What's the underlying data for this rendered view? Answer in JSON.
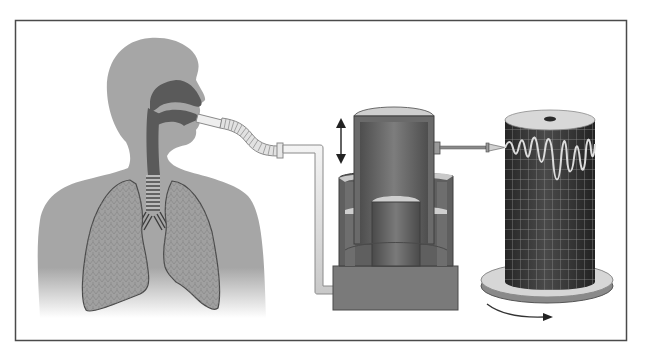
{
  "figure": {
    "labels": [],
    "colors": {
      "background": "#ffffff",
      "frame": "#4a4a4a",
      "body": "#a6a6a6",
      "airway": "#5a5a5a",
      "tube": "#e6e6e6",
      "tube_edge": "#8a8a8a",
      "bell": "#6b6b6b",
      "bell_dark": "#555555",
      "tank": "#7a7a7a",
      "water_surface": "#cfcfcf",
      "drum": "#3a3a3a",
      "drum_grid": "#8c8c8c",
      "trace": "#d8d8d8",
      "disk": "#d6d6d6",
      "disk_edge": "#8a8a8a",
      "arrow": "#222222"
    },
    "components": [
      {
        "name": "person-with-lungs"
      },
      {
        "name": "mouthpiece-and-hose"
      },
      {
        "name": "spirometer-bell"
      },
      {
        "name": "recording-drum"
      }
    ]
  }
}
